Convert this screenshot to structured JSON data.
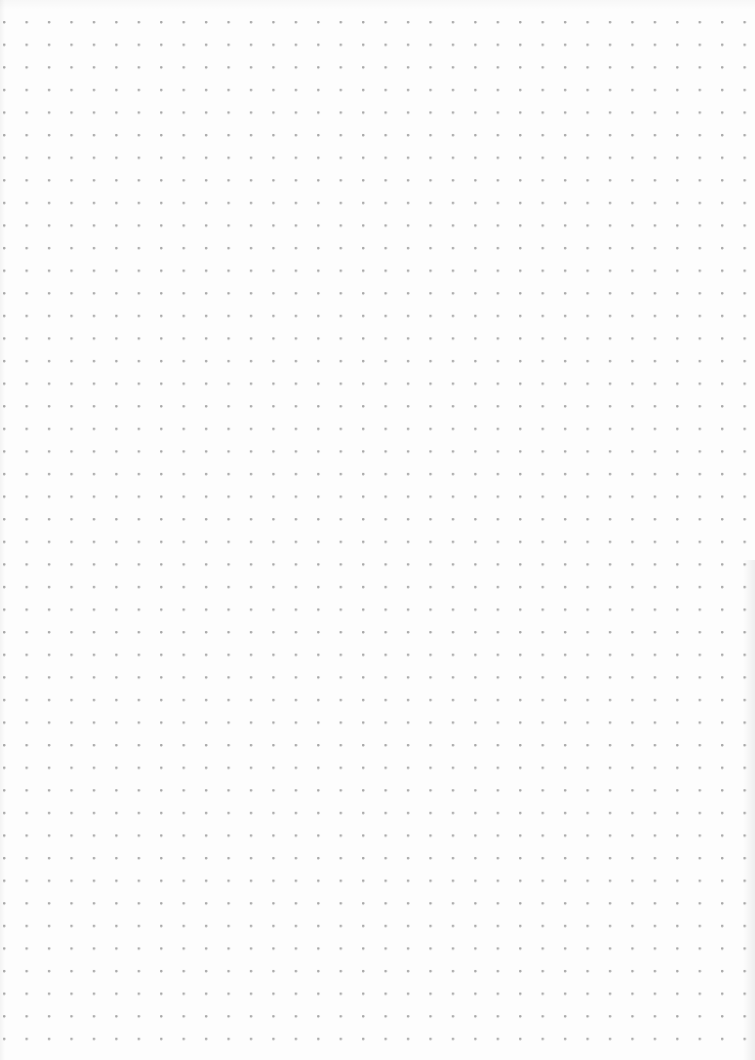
{
  "page": {
    "type": "dot-grid-paper",
    "background_color": "#fdfdfd",
    "dot_color": "#a8a8a8",
    "dot_spacing_px": 22.5,
    "columns": 34,
    "rows": 46
  }
}
